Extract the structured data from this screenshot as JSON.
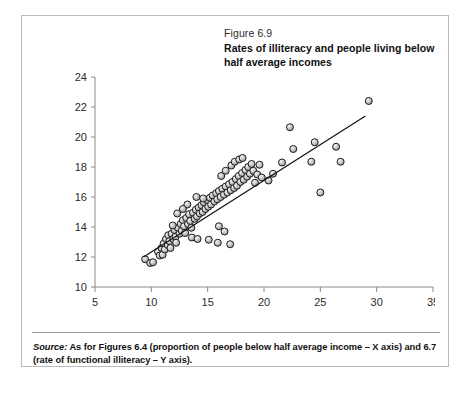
{
  "figure": {
    "number": "Figure 6.9",
    "title": "Rates of illiteracy and people living below half average incomes",
    "source_label": "Source:",
    "source_text": " As for Figures 6.4 (proportion of people below half average income – X axis) and 6.7 (rate of functional illiteracy – Y axis)."
  },
  "colors": {
    "frame": "#b9b9b9",
    "axis": "#8a8a8a",
    "marker_fill": "#cfcfcf",
    "marker_stroke": "#1c1c1c",
    "trend_line": "#111111",
    "text": "#2b2b2b"
  },
  "chart_data": {
    "type": "scatter",
    "title": "Rates of illiteracy and people living below half average incomes",
    "xlabel": "",
    "ylabel": "",
    "xlim": [
      5,
      35
    ],
    "ylim": [
      10,
      24
    ],
    "xticks": [
      5,
      10,
      15,
      20,
      25,
      30,
      35
    ],
    "yticks": [
      10,
      12,
      14,
      16,
      18,
      20,
      22,
      24
    ],
    "grid": false,
    "legend": "none",
    "trend_line": {
      "type": "linear-fit",
      "x_start": 9.3,
      "y_start": 12.0,
      "x_end": 29.0,
      "y_end": 21.4
    },
    "series": [
      {
        "name": "Countries",
        "marker": "sphere",
        "points": [
          [
            9.45,
            11.85
          ],
          [
            9.9,
            11.6
          ],
          [
            10.15,
            11.65
          ],
          [
            10.6,
            12.35
          ],
          [
            10.75,
            12.1
          ],
          [
            10.9,
            12.6
          ],
          [
            11.0,
            12.15
          ],
          [
            11.1,
            12.9
          ],
          [
            11.2,
            12.5
          ],
          [
            11.3,
            13.2
          ],
          [
            11.45,
            12.8
          ],
          [
            11.5,
            13.45
          ],
          [
            11.6,
            13.05
          ],
          [
            11.7,
            12.6
          ],
          [
            11.8,
            13.55
          ],
          [
            11.95,
            13.2
          ],
          [
            12.05,
            13.8
          ],
          [
            12.15,
            13.35
          ],
          [
            12.2,
            12.95
          ],
          [
            12.35,
            13.95
          ],
          [
            12.5,
            13.55
          ],
          [
            12.6,
            14.2
          ],
          [
            12.7,
            13.75
          ],
          [
            12.8,
            14.45
          ],
          [
            12.9,
            14.05
          ],
          [
            13.0,
            13.6
          ],
          [
            13.1,
            14.6
          ],
          [
            13.25,
            14.2
          ],
          [
            13.35,
            14.85
          ],
          [
            13.45,
            14.4
          ],
          [
            13.55,
            13.95
          ],
          [
            13.7,
            14.95
          ],
          [
            13.85,
            14.55
          ],
          [
            13.95,
            15.15
          ],
          [
            14.05,
            14.7
          ],
          [
            14.2,
            15.3
          ],
          [
            14.3,
            14.9
          ],
          [
            14.45,
            15.45
          ],
          [
            14.55,
            15.0
          ],
          [
            14.65,
            15.65
          ],
          [
            14.8,
            15.2
          ],
          [
            14.95,
            15.8
          ],
          [
            15.05,
            15.35
          ],
          [
            15.2,
            15.95
          ],
          [
            15.3,
            15.5
          ],
          [
            15.45,
            16.1
          ],
          [
            15.6,
            15.7
          ],
          [
            15.75,
            16.25
          ],
          [
            15.85,
            15.85
          ],
          [
            16.0,
            16.4
          ],
          [
            16.15,
            16.0
          ],
          [
            16.3,
            16.55
          ],
          [
            16.45,
            16.15
          ],
          [
            16.6,
            16.7
          ],
          [
            16.75,
            16.3
          ],
          [
            16.9,
            16.85
          ],
          [
            17.05,
            16.45
          ],
          [
            17.2,
            17.0
          ],
          [
            17.35,
            16.6
          ],
          [
            17.5,
            17.2
          ],
          [
            17.6,
            16.75
          ],
          [
            17.75,
            17.4
          ],
          [
            17.9,
            17.0
          ],
          [
            18.05,
            17.6
          ],
          [
            18.2,
            17.15
          ],
          [
            18.35,
            17.8
          ],
          [
            18.5,
            17.35
          ],
          [
            18.6,
            18.0
          ],
          [
            18.75,
            17.55
          ],
          [
            18.9,
            18.2
          ],
          [
            19.05,
            17.75
          ],
          [
            19.2,
            16.95
          ],
          [
            19.4,
            17.5
          ],
          [
            19.6,
            18.15
          ],
          [
            19.8,
            17.3
          ],
          [
            13.2,
            15.5
          ],
          [
            14.0,
            16.0
          ],
          [
            14.6,
            15.9
          ],
          [
            16.2,
            17.4
          ],
          [
            16.6,
            17.75
          ],
          [
            17.1,
            18.1
          ],
          [
            17.4,
            18.35
          ],
          [
            17.8,
            18.5
          ],
          [
            18.1,
            18.6
          ],
          [
            12.3,
            14.9
          ],
          [
            12.8,
            15.2
          ],
          [
            11.9,
            14.1
          ],
          [
            13.6,
            13.3
          ],
          [
            14.1,
            13.2
          ],
          [
            15.1,
            13.15
          ],
          [
            15.9,
            12.95
          ],
          [
            16.5,
            13.7
          ],
          [
            17.0,
            12.85
          ],
          [
            16.0,
            14.05
          ],
          [
            20.4,
            17.1
          ],
          [
            20.8,
            17.55
          ],
          [
            21.6,
            18.3
          ],
          [
            22.3,
            20.65
          ],
          [
            22.6,
            19.2
          ],
          [
            24.5,
            19.65
          ],
          [
            24.2,
            18.35
          ],
          [
            25.0,
            16.3
          ],
          [
            26.4,
            19.35
          ],
          [
            26.8,
            18.35
          ],
          [
            29.3,
            22.4
          ]
        ]
      }
    ]
  }
}
